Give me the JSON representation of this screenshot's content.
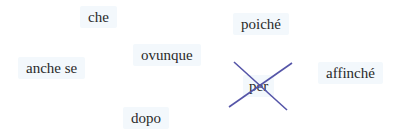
{
  "exercise": {
    "tiles": [
      {
        "id": "che",
        "label": "che",
        "x": 80,
        "y": 6,
        "w": 38
      },
      {
        "id": "poiche",
        "label": "poiché",
        "x": 233,
        "y": 13,
        "w": 62
      },
      {
        "id": "anche-se",
        "label": "anche se",
        "x": 18,
        "y": 57,
        "w": 70
      },
      {
        "id": "ovunque",
        "label": "ovunque",
        "x": 133,
        "y": 44,
        "w": 70
      },
      {
        "id": "per",
        "label": "per",
        "x": 243,
        "y": 75,
        "w": 36,
        "crossed_out": true
      },
      {
        "id": "affinche",
        "label": "affinché",
        "x": 318,
        "y": 62,
        "w": 70
      },
      {
        "id": "dopo",
        "label": "dopo",
        "x": 123,
        "y": 107,
        "w": 50
      }
    ],
    "cross_color": "#5555a8"
  }
}
